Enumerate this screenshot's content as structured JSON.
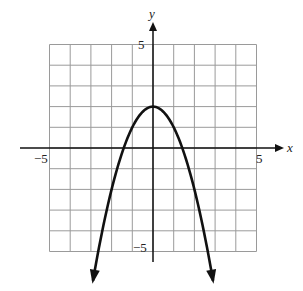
{
  "chart_data": {
    "type": "line",
    "title": "",
    "xlabel": "x",
    "ylabel": "y",
    "xlim": [
      -5,
      5
    ],
    "ylim": [
      -5,
      5
    ],
    "grid": true,
    "grid_step": 1,
    "tick_labels": {
      "x": [
        "-5",
        "5"
      ],
      "y": [
        "5",
        "-5"
      ]
    },
    "series": [
      {
        "name": "y = -x^2 + 2",
        "equation": "y = -x^2 + 2",
        "vertex": [
          0,
          2
        ],
        "x_intercepts": [
          -1.41,
          1.41
        ],
        "x": [
          -2.9,
          -2.5,
          -2,
          -1.5,
          -1,
          -0.5,
          0,
          0.5,
          1,
          1.5,
          2,
          2.5,
          2.9
        ],
        "y": [
          -6.41,
          -4.25,
          -2,
          -0.25,
          1,
          1.75,
          2,
          1.75,
          1,
          -0.25,
          -2,
          -4.25,
          -6.41
        ],
        "arrows_at_ends": true
      }
    ],
    "legend": null
  },
  "labels": {
    "x_axis": "x",
    "y_axis": "y",
    "x_min": "−5",
    "x_max": "5",
    "y_max": "5",
    "y_min": "−5"
  },
  "colors": {
    "grid": "#9a9a9a",
    "axis": "#111111",
    "curve": "#111111"
  }
}
